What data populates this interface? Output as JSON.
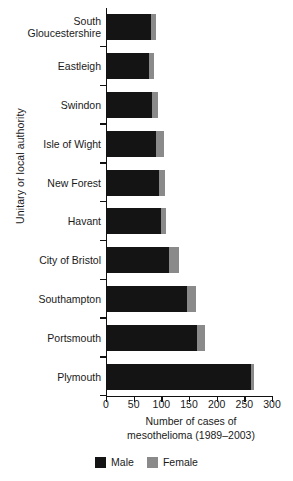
{
  "chart_data": {
    "type": "bar",
    "orientation": "horizontal",
    "stacked": true,
    "title": "",
    "xlabel": "Number of cases of mesothelioma (1989–2003)",
    "xlabel_line1": "Number of cases of",
    "xlabel_line2": "mesothelioma (1989–2003)",
    "ylabel": "Unitary or local authority",
    "categories": [
      "South Gloucestershire",
      "Eastleigh",
      "Swindon",
      "Isle of Wight",
      "New Forest",
      "Havant",
      "City of Bristol",
      "Southampton",
      "Portsmouth",
      "Plymouth"
    ],
    "series": [
      {
        "name": "Male",
        "color": "#141414",
        "values": [
          80,
          76,
          81,
          88,
          94,
          97,
          112,
          145,
          162,
          260
        ]
      },
      {
        "name": "Female",
        "color": "#8a8a8a",
        "values": [
          9,
          9,
          11,
          15,
          10,
          10,
          18,
          16,
          15,
          6
        ]
      }
    ],
    "xlim": [
      0,
      300
    ],
    "xticks": [
      0,
      50,
      100,
      150,
      200,
      250,
      300
    ],
    "xtick_labels": [
      "0",
      "50",
      "100",
      "150",
      "200",
      "250",
      "300"
    ],
    "grid": false,
    "legend_position": "bottom"
  },
  "legend": {
    "male_label": "Male",
    "female_label": "Female"
  }
}
